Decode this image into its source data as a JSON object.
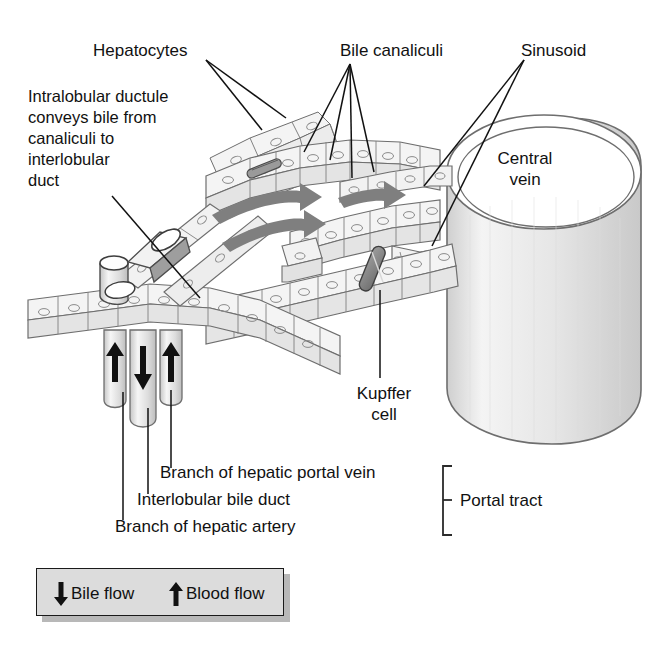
{
  "diagram": {
    "background_color": "#ffffff",
    "line_color": "#1a1a1a",
    "cell_fill": "#f2f2f2",
    "cell_shade": "#d9d9d9",
    "blood_arrow_color": "#808080",
    "kupffer_color": "#8c8c8c",
    "cylinder_fill": "#e8e8e8",
    "legend_fill": "#dcdcdc"
  },
  "labels": {
    "hepatocytes": "Hepatocytes",
    "intralobular": "Intralobular ductule\nconveys bile from\ncanaliculi to\ninterlobular\nduct",
    "bile_canaliculi": "Bile canaliculi",
    "sinusoid": "Sinusoid",
    "central_vein": "Central\nvein",
    "kupffer_cell": "Kupffer\ncell",
    "portal_vein": "Branch of hepatic portal vein",
    "bile_duct": "Interlobular bile duct",
    "hepatic_artery": "Branch of hepatic artery",
    "portal_tract": "Portal tract"
  },
  "legend": {
    "bile_flow": "Bile flow",
    "blood_flow": "Blood flow",
    "bile_arrow_icon": "arrow-down-icon",
    "blood_arrow_icon": "arrow-up-icon"
  },
  "icons": {
    "blood_flow_arrows": "curved-arrow-right-icon",
    "portal_arrows_up": "arrow-up-icon",
    "portal_arrow_down": "arrow-down-icon",
    "portal_tract_bracket": "bracket-icon"
  }
}
